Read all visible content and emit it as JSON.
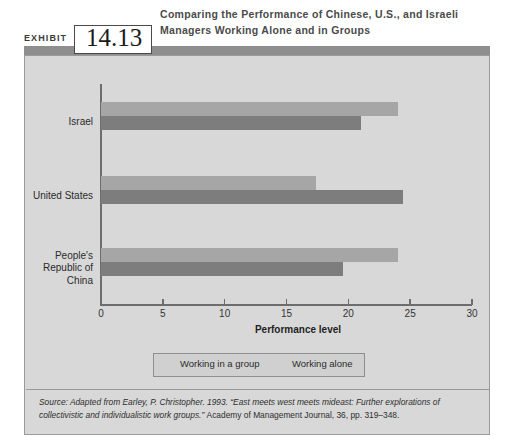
{
  "header": {
    "exhibit_word": "EXHIBIT",
    "exhibit_number": "14.13",
    "title": "Comparing the Performance of Chinese, U.S., and Israeli Managers Working Alone and in Groups"
  },
  "source": {
    "italic_part": "Source: Adapted from Earley, P. Christopher. 1993. “East meets west meets mideast: Further explorations of collectivistic and individualistic work groups.” ",
    "roman_part": "Academy of Management Journal, 36, pp. 319–348."
  },
  "colors": {
    "panel_background": "#d8d8d8",
    "bar_group": "#a6a6a6",
    "bar_alone": "#7d7d7d",
    "axis": "#6d6d6d",
    "rule": "#8e8e8e",
    "text": "#2b2b2b"
  },
  "chart_data": {
    "type": "bar",
    "orientation": "horizontal",
    "title": "Comparing the Performance of Chinese, U.S., and Israeli Managers Working Alone and in Groups",
    "xlabel": "Performance level",
    "ylabel": "",
    "xlim": [
      0,
      30
    ],
    "xticks": [
      0,
      5,
      10,
      15,
      20,
      25,
      30
    ],
    "xtick_labels": [
      "0",
      "5",
      "10",
      "15",
      "20",
      "25",
      "30"
    ],
    "grid": false,
    "legend_position": "bottom",
    "categories": [
      "Israel",
      "United States",
      "People's\nRepublic of\nChina"
    ],
    "series": [
      {
        "name": "Working in a group",
        "color": "#a6a6a6",
        "values": [
          24.0,
          17.4,
          24.0
        ]
      },
      {
        "name": "Working alone",
        "color": "#7d7d7d",
        "values": [
          21.0,
          24.4,
          19.6
        ]
      }
    ]
  }
}
